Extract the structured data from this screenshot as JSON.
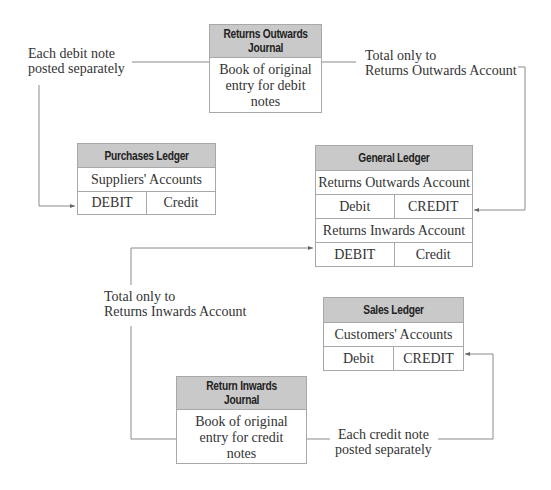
{
  "returns_outwards_journal": {
    "title_line1": "Returns Outwards",
    "title_line2": "Journal",
    "body_line1": "Book of original",
    "body_line2": "entry for debit",
    "body_line3": "notes"
  },
  "return_inwards_journal": {
    "title_line1": "Return Inwards",
    "title_line2": "Journal",
    "body_line1": "Book of original",
    "body_line2": "entry for credit",
    "body_line3": "notes"
  },
  "purchases_ledger": {
    "title": "Purchases Ledger",
    "account": "Suppliers' Accounts",
    "debit": "DEBIT",
    "credit": "Credit"
  },
  "general_ledger": {
    "title": "General Ledger",
    "account1": "Returns Outwards Account",
    "account1_debit": "Debit",
    "account1_credit": "CREDIT",
    "account2": "Returns Inwards Account",
    "account2_debit": "DEBIT",
    "account2_credit": "Credit"
  },
  "sales_ledger": {
    "title": "Sales Ledger",
    "account": "Customers' Accounts",
    "debit": "Debit",
    "credit": "CREDIT"
  },
  "labels": {
    "debit_note_line1": "Each debit note",
    "debit_note_line2": "posted separately",
    "total_outwards_line1": "Total only to",
    "total_outwards_line2": "Returns Outwards Account",
    "total_inwards_line1": "Total only to",
    "total_inwards_line2": "Returns Inwards Account",
    "credit_note_line1": "Each credit note",
    "credit_note_line2": "posted separately"
  },
  "colors": {
    "header_fill": "#c9c9c9",
    "border": "#a8a8a8",
    "line": "#8a8a8a"
  }
}
